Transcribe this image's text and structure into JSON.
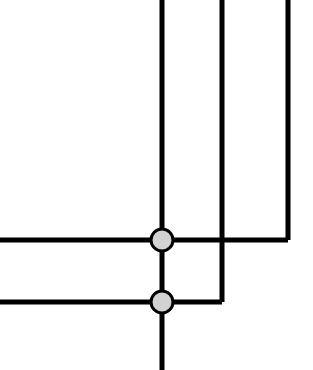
{
  "diagram": {
    "type": "node-link-orthogonal",
    "canvas": {
      "width": 313,
      "height": 370,
      "background_color": "#ffffff"
    },
    "style": {
      "line_color": "#000000",
      "line_width": 5,
      "node_fill_color": "#d2d2d2",
      "node_stroke_color": "#000000",
      "node_stroke_width": 3,
      "node_radius": 11
    },
    "nodes": [
      {
        "id": "node-upper",
        "label": "upper-junction-node",
        "cx": 162,
        "cy": 240,
        "r": 11
      },
      {
        "id": "node-lower",
        "label": "lower-junction-node",
        "cx": 162,
        "cy": 302,
        "r": 11
      }
    ],
    "segments": [
      {
        "id": "trunk-vertical-top",
        "label": "vertical-line-top-to-upper-node",
        "orientation": "vertical",
        "x1": 162,
        "y1": 0,
        "x2": 162,
        "y2": 240
      },
      {
        "id": "branch-vertical-middle",
        "label": "vertical-line-second-from-top",
        "orientation": "vertical",
        "x1": 222,
        "y1": 0,
        "x2": 222,
        "y2": 302
      },
      {
        "id": "branch-vertical-right",
        "label": "vertical-line-third-from-top",
        "orientation": "vertical",
        "x1": 288,
        "y1": 0,
        "x2": 288,
        "y2": 240
      },
      {
        "id": "horizontal-upper",
        "label": "horizontal-line-upper-left-to-right-corner",
        "orientation": "horizontal",
        "x1": 0,
        "y1": 240,
        "x2": 288,
        "y2": 240
      },
      {
        "id": "horizontal-lower",
        "label": "horizontal-line-lower-left-to-middle-corner",
        "orientation": "horizontal",
        "x1": 0,
        "y1": 302,
        "x2": 222,
        "y2": 302
      },
      {
        "id": "internode-vertical",
        "label": "vertical-line-between-nodes",
        "orientation": "vertical",
        "x1": 162,
        "y1": 240,
        "x2": 162,
        "y2": 302
      },
      {
        "id": "trunk-vertical-bottom",
        "label": "vertical-line-lower-node-to-bottom",
        "orientation": "vertical",
        "x1": 162,
        "y1": 302,
        "x2": 162,
        "y2": 370
      }
    ],
    "crossings": [
      {
        "id": "crossing-middle-over-upper",
        "label": "uncoupled-crossing",
        "x": 222,
        "y": 240
      }
    ],
    "corners": [
      {
        "id": "corner-upper-right",
        "label": "corner-upper-horizontal-to-right-vertical",
        "x": 288,
        "y": 240
      },
      {
        "id": "corner-lower-middle",
        "label": "corner-lower-horizontal-to-middle-vertical",
        "x": 222,
        "y": 302
      }
    ]
  }
}
